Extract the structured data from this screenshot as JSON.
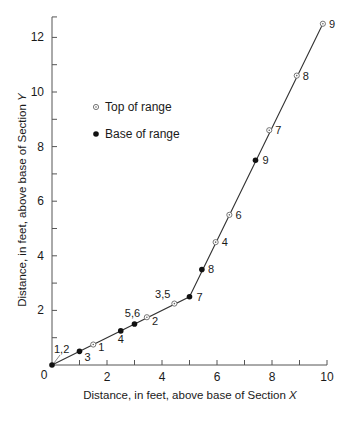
{
  "chart_data": {
    "type": "scatter",
    "title": "",
    "xlabel": "Distance, in feet, above base of Section X",
    "ylabel": "Distance, in feet, above base of Section Y",
    "xlim": [
      0,
      10
    ],
    "ylim": [
      0,
      12.5
    ],
    "x_ticks_major": [
      0,
      2,
      4,
      6,
      8,
      10
    ],
    "x_ticks_minor": [
      1,
      3,
      5,
      7,
      9
    ],
    "y_ticks_major": [
      0,
      2,
      4,
      6,
      8,
      10,
      12
    ],
    "y_ticks_minor": [
      1,
      3,
      5,
      7,
      9,
      11
    ],
    "grid": false,
    "legend": {
      "position": "upper-left",
      "entries": [
        {
          "label": "Top of range",
          "marker": "open-circle-dot"
        },
        {
          "label": "Base of range",
          "marker": "filled-circle"
        }
      ]
    },
    "series": [
      {
        "name": "Top of range",
        "marker": "open-circle-dot",
        "points": [
          {
            "x": 1.5,
            "y": 0.75,
            "label": "1"
          },
          {
            "x": 3.45,
            "y": 1.75,
            "label": "2"
          },
          {
            "x": 4.45,
            "y": 2.25,
            "label": "3,5"
          },
          {
            "x": 5.95,
            "y": 4.5,
            "label": "4"
          },
          {
            "x": 6.45,
            "y": 5.5,
            "label": "6"
          },
          {
            "x": 7.9,
            "y": 8.6,
            "label": "7"
          },
          {
            "x": 8.9,
            "y": 10.6,
            "label": "8"
          },
          {
            "x": 9.85,
            "y": 12.5,
            "label": "9"
          }
        ]
      },
      {
        "name": "Base of range",
        "marker": "filled-circle",
        "points": [
          {
            "x": 0.0,
            "y": 0.0,
            "label": "1,2"
          },
          {
            "x": 1.0,
            "y": 0.5,
            "label": "3"
          },
          {
            "x": 2.5,
            "y": 1.25,
            "label": "4"
          },
          {
            "x": 3.0,
            "y": 1.5,
            "label": "5,6"
          },
          {
            "x": 5.0,
            "y": 2.5,
            "label": "7"
          },
          {
            "x": 5.45,
            "y": 3.5,
            "label": "8"
          },
          {
            "x": 7.4,
            "y": 7.5,
            "label": "9"
          }
        ]
      }
    ],
    "trend_line": [
      {
        "x": 0.0,
        "y": 0.0
      },
      {
        "x": 5.0,
        "y": 2.5
      },
      {
        "x": 9.85,
        "y": 12.5
      }
    ]
  },
  "axes": {
    "xlabel_prefix": "Distance, in feet, above base of Section ",
    "xlabel_var": "X",
    "ylabel_prefix": "Distance, in feet, above base of Section ",
    "ylabel_var": "Y",
    "origin_label": "0",
    "x_tick_labels": [
      "2",
      "4",
      "6",
      "8",
      "10"
    ],
    "y_tick_labels": [
      "2",
      "4",
      "6",
      "8",
      "10",
      "12"
    ]
  },
  "legend": {
    "top_label": "Top of range",
    "base_label": "Base of range"
  }
}
